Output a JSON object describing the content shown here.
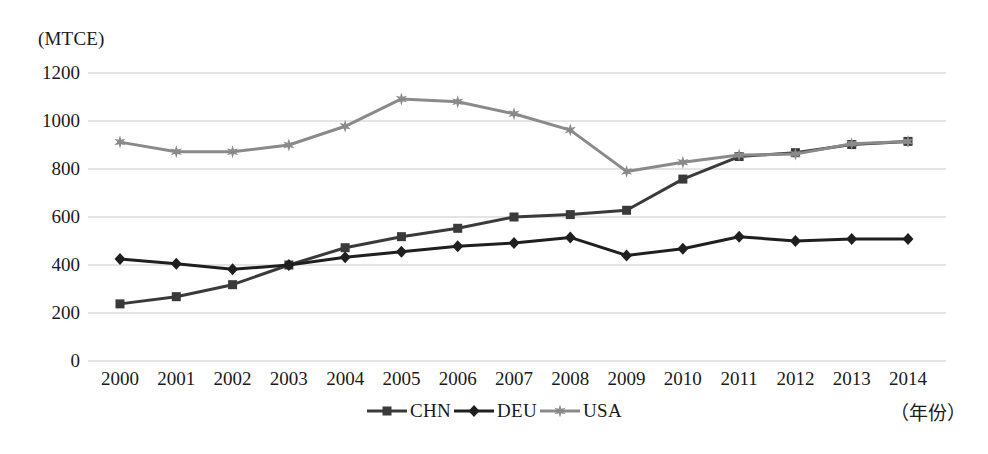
{
  "chart_data": {
    "type": "line",
    "title": "",
    "ylabel": "(MTCE)",
    "xlabel": "（年份）",
    "ylim": [
      0,
      1200
    ],
    "ytick_labels": [
      "1200",
      "1000",
      "800",
      "600",
      "400",
      "200",
      "0"
    ],
    "yticks": [
      1200,
      1000,
      800,
      600,
      400,
      200,
      0
    ],
    "grid": true,
    "grid_axis": "y",
    "legend_position": "bottom-center",
    "categories": [
      "2000",
      "2001",
      "2002",
      "2003",
      "2004",
      "2005",
      "2006",
      "2007",
      "2008",
      "2009",
      "2010",
      "2011",
      "2012",
      "2013",
      "2014"
    ],
    "x": [
      2000,
      2001,
      2002,
      2003,
      2004,
      2005,
      2006,
      2007,
      2008,
      2009,
      2010,
      2011,
      2012,
      2013,
      2014
    ],
    "series": [
      {
        "name": "CHN",
        "marker": "square",
        "color": "#3a3a3a",
        "values": [
          238,
          268,
          318,
          400,
          472,
          518,
          553,
          600,
          610,
          628,
          758,
          852,
          868,
          902,
          915
        ]
      },
      {
        "name": "DEU",
        "marker": "diamond",
        "color": "#1f1f1f",
        "values": [
          425,
          405,
          382,
          400,
          432,
          455,
          478,
          492,
          515,
          440,
          468,
          518,
          500,
          508,
          508
        ]
      },
      {
        "name": "USA",
        "marker": "star",
        "color": "#8a8a8a",
        "values": [
          912,
          872,
          872,
          900,
          978,
          1092,
          1080,
          1030,
          962,
          790,
          828,
          858,
          862,
          905,
          915
        ]
      }
    ]
  },
  "legend": {
    "entries": [
      {
        "label": "CHN",
        "marker": "square-marker-icon",
        "color": "#3a3a3a"
      },
      {
        "label": "DEU",
        "marker": "diamond-marker-icon",
        "color": "#1f1f1f"
      },
      {
        "label": "USA",
        "marker": "star-marker-icon",
        "color": "#8a8a8a"
      }
    ]
  },
  "colors": {
    "gridline": "#c9c9c9",
    "background": "#ffffff",
    "text": "#1a1a1a"
  }
}
